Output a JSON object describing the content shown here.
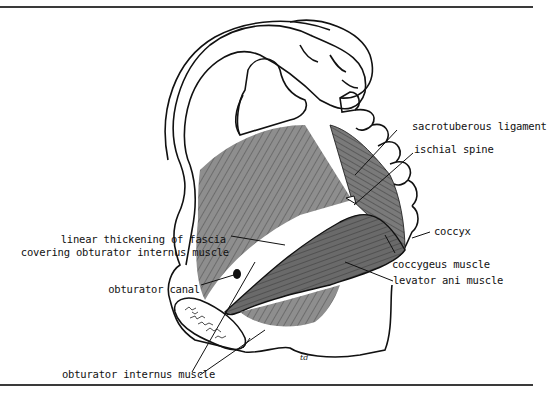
{
  "figure": {
    "artist_initials": "td",
    "colors": {
      "outline": "#111111",
      "muscle_light": "#8e8e8e",
      "muscle_dark": "#5f5f5f",
      "background": "#ffffff"
    }
  },
  "labels": {
    "sacrotuberous_ligament": "sacrotuberous ligament",
    "ischial_spine": "ischial spine",
    "coccyx": "coccyx",
    "coccygeus_muscle": "coccygeus muscle",
    "levator_ani_muscle": "levator ani muscle",
    "linear_thickening_line1": "linear thickening of fascia",
    "linear_thickening_line2": "covering obturator internus muscle",
    "obturator_canal": "obturator canal",
    "obturator_internus_muscle": "obturator internus muscle"
  }
}
